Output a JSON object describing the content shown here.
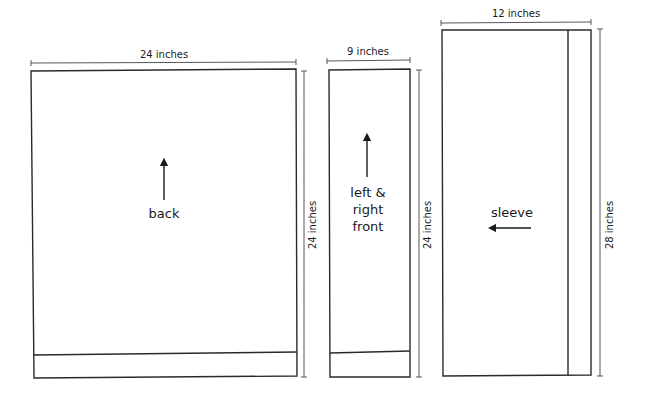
{
  "diagram": {
    "type": "garment-schematic",
    "pieces": [
      {
        "id": "back",
        "label": "back",
        "width": "24 inches",
        "height": "24 inches",
        "arrow": "up"
      },
      {
        "id": "front",
        "label_lines": [
          "left &",
          "right",
          "front"
        ],
        "width": "9 inches",
        "height": "24 inches",
        "arrow": "up"
      },
      {
        "id": "sleeve",
        "label": "sleeve",
        "width": "12 inches",
        "height": "28 inches",
        "arrow": "left"
      }
    ]
  }
}
